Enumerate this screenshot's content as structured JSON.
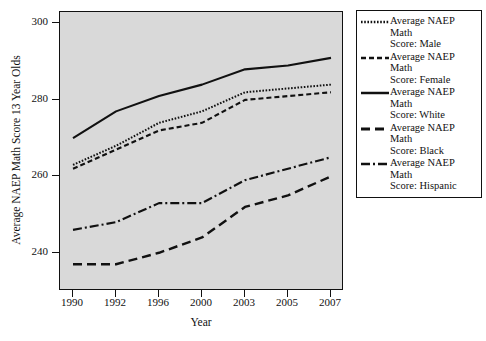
{
  "chart_data": {
    "type": "line",
    "title": "",
    "xlabel": "Year",
    "ylabel": "Average NAEP Math Score 13 Year Olds",
    "categories": [
      "1990",
      "1992",
      "1996",
      "2000",
      "2003",
      "2005",
      "2007"
    ],
    "xtick_labels": [
      "1990",
      "1992",
      "1996",
      "2000",
      "2003",
      "2005",
      "2007"
    ],
    "ytick_labels": [
      "240",
      "260",
      "280",
      "300"
    ],
    "ylim": [
      230,
      303
    ],
    "ytick_values": [
      240,
      260,
      280,
      300
    ],
    "grid": false,
    "legend_position": "right-outside",
    "plot_background": "#d9d9d9",
    "line_color": "#111111",
    "series": [
      {
        "name": "Average NAEP Math Score: Male",
        "short": "Male",
        "style": "dotted",
        "values": [
          263,
          268,
          274,
          277,
          282,
          283,
          284
        ]
      },
      {
        "name": "Average NAEP Math Score: Female",
        "short": "Female",
        "style": "dashed-short",
        "values": [
          262,
          267,
          272,
          274,
          280,
          281,
          282
        ]
      },
      {
        "name": "Average NAEP Math Score: White",
        "short": "White",
        "style": "solid",
        "values": [
          270,
          277,
          281,
          284,
          288,
          289,
          291
        ]
      },
      {
        "name": "Average NAEP Math Score: Black",
        "short": "Black",
        "style": "dashed-long",
        "values": [
          237,
          237,
          240,
          244,
          252,
          255,
          260
        ]
      },
      {
        "name": "Average NAEP Math Score: Hispanic",
        "short": "Hispanic",
        "style": "dash-dot",
        "values": [
          246,
          248,
          253,
          253,
          259,
          262,
          265
        ]
      }
    ]
  },
  "legend": {
    "items": [
      {
        "line1": "Average NAEP Math",
        "line2": "Score: Male",
        "style": "dotted"
      },
      {
        "line1": "Average NAEP Math",
        "line2": "Score: Female",
        "style": "dashed-short"
      },
      {
        "line1": "Average NAEP Math",
        "line2": "Score: White",
        "style": "solid"
      },
      {
        "line1": "Average NAEP Math",
        "line2": "Score: Black",
        "style": "dashed-long"
      },
      {
        "line1": "Average NAEP Math",
        "line2": "Score: Hispanic",
        "style": "dash-dot"
      }
    ]
  }
}
